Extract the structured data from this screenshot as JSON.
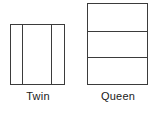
{
  "diagram": {
    "background_color": "#ffffff",
    "stroke_color": "#3b3b3b",
    "label_color": "#1a1a1a",
    "figures": [
      {
        "id": "twin",
        "label": "Twin",
        "shape": "rectangle",
        "orientation": "portrait",
        "segments": 3,
        "segment_direction": "vertical",
        "divider_count": 2
      },
      {
        "id": "queen",
        "label": "Queen",
        "shape": "rectangle",
        "orientation": "portrait",
        "segments": 3,
        "segment_direction": "horizontal",
        "divider_count": 2
      }
    ]
  }
}
